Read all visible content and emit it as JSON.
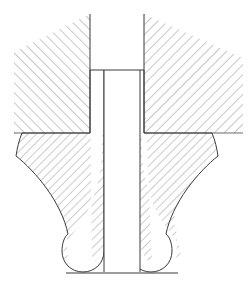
{
  "drawing": {
    "kind": "engineering-cross-section",
    "title": "Cross-section of a flanged bulb-footed fastener seated between two hatched members",
    "canvas": {
      "width": 251,
      "height": 290,
      "background": "#ffffff"
    },
    "line_color": "#3a3a3a",
    "hatch_color": "#6b6b6b",
    "hatch_spacing_px": 7,
    "labels": [],
    "dimensions": [],
    "annotations": [],
    "regions": [
      {
        "id": "upper-left-member",
        "name": "upper-left-hatched-member",
        "hatch_angle_deg": 45,
        "hatch_spacing_px": 7,
        "description": "Sectioned member at upper left; vertical right face meets the fastener bore wall.",
        "path": "M 90,14 L 90,133 L 22,133 L 22,133 Z",
        "points": [
          [
            90,
            14
          ],
          [
            90,
            133
          ],
          [
            22,
            133
          ]
        ]
      },
      {
        "id": "upper-right-member",
        "name": "upper-right-hatched-member",
        "hatch_angle_deg": -45,
        "hatch_spacing_px": 7,
        "description": "Sectioned member at upper right; hatching runs opposite to the left member.",
        "path": "M 144,14 L 144,133 L 240,133 L 240,14 Z",
        "points": [
          [
            144,
            14
          ],
          [
            144,
            133
          ],
          [
            240,
            133
          ],
          [
            240,
            14
          ]
        ]
      },
      {
        "id": "fastener-left-body",
        "name": "fastener-left-section",
        "hatch_angle_deg": -45,
        "hatch_spacing_px": 6,
        "description": "Left half of the sectioned fastener: bore wall, flared flange with concave fillet, rounded bulb foot.",
        "points": [
          [
            90,
            70
          ],
          [
            90,
            133
          ],
          [
            22,
            133
          ],
          [
            16,
            156
          ],
          [
            68,
            240
          ],
          [
            68,
            275
          ],
          [
            104,
            275
          ],
          [
            104,
            70
          ]
        ]
      },
      {
        "id": "fastener-right-body",
        "name": "fastener-right-section",
        "hatch_angle_deg": -45,
        "hatch_spacing_px": 6,
        "description": "Right half of the sectioned fastener: mirror of the left half.",
        "points": [
          [
            144,
            70
          ],
          [
            144,
            133
          ],
          [
            212,
            133
          ],
          [
            218,
            156
          ],
          [
            176,
            240
          ],
          [
            176,
            275
          ],
          [
            140,
            275
          ],
          [
            140,
            70
          ]
        ]
      },
      {
        "id": "central-bore",
        "name": "central-bore-void",
        "hatch_angle_deg": null,
        "description": "Unhatched central through-bore between the two fastener walls, open at the bottom.",
        "points": [
          [
            104,
            70
          ],
          [
            140,
            70
          ],
          [
            140,
            275
          ],
          [
            104,
            275
          ]
        ]
      }
    ],
    "features": [
      {
        "name": "bore-top-shoulder",
        "y": 70,
        "x_from": 90,
        "x_to": 144
      },
      {
        "name": "flange-seat-line",
        "y": 133,
        "x_from": 16,
        "x_to": 218
      },
      {
        "name": "left-bulb-foot",
        "center_x": 86,
        "center_y": 257,
        "radius": 18
      },
      {
        "name": "right-bulb-foot",
        "center_x": 158,
        "center_y": 257,
        "radius": 18
      },
      {
        "name": "base-line",
        "y": 275,
        "x_from": 68,
        "x_to": 176
      }
    ]
  }
}
